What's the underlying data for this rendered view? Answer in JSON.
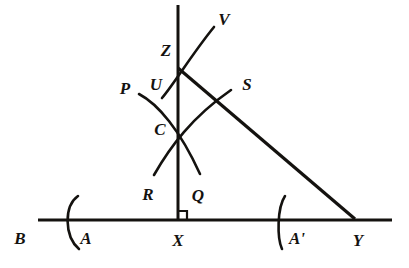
{
  "figure": {
    "ink_color": "#14120f",
    "background_color": "#ffffff",
    "labels": [
      {
        "name": "label-B",
        "text": "B",
        "x": 20,
        "y": 238
      },
      {
        "name": "label-A",
        "text": "A",
        "x": 86,
        "y": 238
      },
      {
        "name": "label-X",
        "text": "X",
        "x": 178,
        "y": 240
      },
      {
        "name": "label-A-prime",
        "text": "A'",
        "x": 297,
        "y": 238
      },
      {
        "name": "label-Y",
        "text": "Y",
        "x": 358,
        "y": 240
      },
      {
        "name": "label-R",
        "text": "R",
        "x": 148,
        "y": 194
      },
      {
        "name": "label-Q",
        "text": "Q",
        "x": 198,
        "y": 195
      },
      {
        "name": "label-C",
        "text": "C",
        "x": 160,
        "y": 129
      },
      {
        "name": "label-P",
        "text": "P",
        "x": 125,
        "y": 88
      },
      {
        "name": "label-U",
        "text": "U",
        "x": 156,
        "y": 84
      },
      {
        "name": "label-S",
        "text": "S",
        "x": 247,
        "y": 84
      },
      {
        "name": "label-Z",
        "text": "Z",
        "x": 166,
        "y": 50
      },
      {
        "name": "label-V",
        "text": "V",
        "x": 224,
        "y": 19
      }
    ],
    "geometry": {
      "baseline": {
        "name": "baseline-BY",
        "x1": 38,
        "y1": 220,
        "x2": 392,
        "y2": 220,
        "width": 3.2
      },
      "perpendicular": {
        "name": "perpendicular-XZ",
        "x1": 178,
        "y1": 5,
        "x2": 178,
        "y2": 220,
        "width": 3.0
      },
      "hypotenuse": {
        "name": "segment-ZY",
        "x1": 178,
        "y1": 68,
        "x2": 355,
        "y2": 219,
        "width": 3.2
      },
      "right_angle": {
        "name": "right-angle-marker-at-X",
        "x": 178,
        "y": 220,
        "size": 9,
        "width": 2.2
      },
      "points": {
        "X": {
          "x": 178,
          "y": 220
        },
        "C": {
          "x": 178,
          "y": 129
        },
        "Z": {
          "x": 178,
          "y": 68
        },
        "Y": {
          "x": 355,
          "y": 219
        },
        "A": {
          "x": 72,
          "y": 220
        },
        "A_prime": {
          "x": 280,
          "y": 220
        },
        "S_crossing": {
          "x": 211,
          "y": 95
        }
      },
      "arcs": [
        {
          "name": "arc-A-left-baseline",
          "path": "M 78 196 C 64 206 64 236 79 249",
          "width": 2.6
        },
        {
          "name": "arc-A-prime-right-baseline",
          "path": "M 285 196 C 277 208 277 238 282 249",
          "width": 2.6
        },
        {
          "name": "arc-P-to-Q",
          "path": "M 139 94 C 158 104 180 130 200 174",
          "width": 2.6
        },
        {
          "name": "arc-R-to-S",
          "path": "M 154 175 C 170 147 192 117 231 90",
          "width": 2.6
        },
        {
          "name": "arc-U-to-V",
          "path": "M 162 98 C 174 84 192 54 214 27",
          "width": 2.6
        }
      ]
    }
  }
}
